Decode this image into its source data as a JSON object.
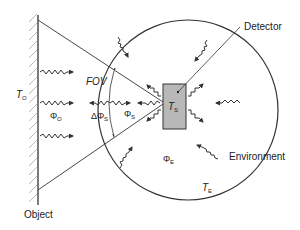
{
  "diagram": {
    "labels": {
      "detector": "Detector",
      "environment": "Environment",
      "object": "Object",
      "fov": "FOV",
      "t_object": "T",
      "t_object_sub": "O",
      "t_sensor": "T",
      "t_sensor_sub": "S",
      "t_env": "T",
      "t_env_sub": "E",
      "phi_object": "Φ",
      "phi_object_sub": "O",
      "delta_phi_s": "ΔΦ",
      "delta_phi_s_sub": "S",
      "phi_s": "Φ",
      "phi_s_sub": "S",
      "phi_env": "Φ",
      "phi_env_sub": "E"
    },
    "colors": {
      "line": "#333333",
      "detector_fill": "#b8b8b8",
      "hatch": "#999999"
    }
  }
}
